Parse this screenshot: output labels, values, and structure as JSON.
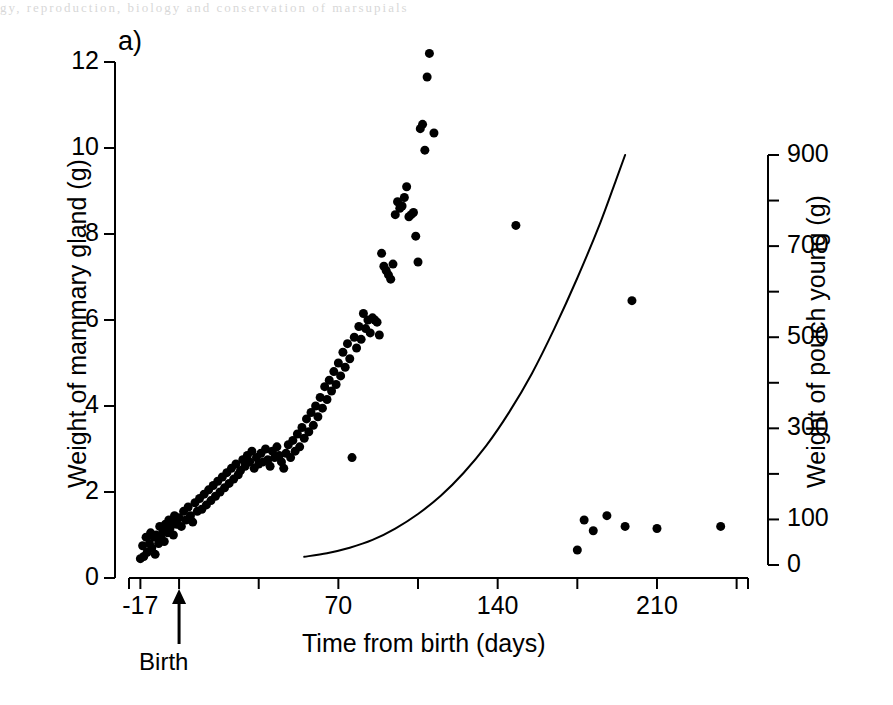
{
  "figure": {
    "panel_label": "a)",
    "page_remnant": "gy, reproduction, biology and conservation of marsupials",
    "background_color": "#ffffff",
    "ink_color": "#000000"
  },
  "axes": {
    "left": {
      "title": "Weight of mammary gland (g)",
      "tick_labels": [
        "0",
        "2",
        "4",
        "6",
        "8",
        "10",
        "12"
      ],
      "range": [
        0,
        12
      ]
    },
    "right": {
      "title": "Weight of pouch young (g)",
      "tick_labels": [
        "0",
        "100",
        "300",
        "500",
        "700",
        "900"
      ],
      "labeled_ticks": [
        0,
        100,
        300,
        500,
        700,
        900
      ],
      "minor_ticks": [
        200,
        400,
        600,
        800
      ],
      "range": [
        0,
        900
      ]
    },
    "x": {
      "title": "Time from birth (days)",
      "tick_labels": [
        "-17",
        "70",
        "140",
        "210"
      ],
      "labeled_ticks": [
        -17,
        70,
        140,
        210
      ],
      "unlabeled_ticks": [
        0,
        35,
        105,
        175,
        245
      ],
      "range": [
        -22,
        250
      ],
      "birth_marker": {
        "label": "Birth",
        "day": 0
      }
    }
  },
  "chart_data": {
    "type": "scatter",
    "title": "",
    "subtitle": "",
    "xlabel": "Time from birth (days)",
    "ylabel": "Weight of mammary gland (g)",
    "y2label": "Weight of pouch young (g)",
    "xlim": [
      -22,
      250
    ],
    "ylim": [
      0,
      12
    ],
    "y2lim": [
      0,
      900
    ],
    "grid": false,
    "legend": "none",
    "annotations": [
      {
        "text": "a)",
        "position": "top-left"
      },
      {
        "text": "Birth",
        "position": "x-axis day 0",
        "marker": "up-arrow"
      }
    ],
    "series": [
      {
        "name": "Weight of mammary gland",
        "type": "scatter",
        "axis": "left",
        "marker": "filled-circle",
        "marker_color": "#000000",
        "marker_size_px": 9,
        "points": [
          [
            -17.0,
            0.45
          ],
          [
            -16.0,
            0.75
          ],
          [
            -15.5,
            0.5
          ],
          [
            -14.5,
            0.95
          ],
          [
            -14.0,
            0.6
          ],
          [
            -13.0,
            0.8
          ],
          [
            -12.5,
            1.05
          ],
          [
            -12.0,
            0.7
          ],
          [
            -11.0,
            0.95
          ],
          [
            -10.5,
            0.55
          ],
          [
            -10.0,
            1.0
          ],
          [
            -9.0,
            0.8
          ],
          [
            -8.5,
            1.2
          ],
          [
            -8.0,
            0.95
          ],
          [
            -7.0,
            1.1
          ],
          [
            -6.5,
            0.85
          ],
          [
            -6.0,
            1.25
          ],
          [
            -5.0,
            1.05
          ],
          [
            -4.5,
            1.35
          ],
          [
            -4.0,
            1.15
          ],
          [
            -3.0,
            1.3
          ],
          [
            -2.5,
            1.0
          ],
          [
            -2.0,
            1.45
          ],
          [
            -1.0,
            1.25
          ],
          [
            0.0,
            1.4
          ],
          [
            1.0,
            1.2
          ],
          [
            2.0,
            1.55
          ],
          [
            3.0,
            1.35
          ],
          [
            4.0,
            1.65
          ],
          [
            5.0,
            1.45
          ],
          [
            6.0,
            1.3
          ],
          [
            7.0,
            1.75
          ],
          [
            8.0,
            1.55
          ],
          [
            9.0,
            1.85
          ],
          [
            10.0,
            1.6
          ],
          [
            11.0,
            1.95
          ],
          [
            12.0,
            1.7
          ],
          [
            13.0,
            2.05
          ],
          [
            14.0,
            1.8
          ],
          [
            15.0,
            2.15
          ],
          [
            16.0,
            1.9
          ],
          [
            17.0,
            2.25
          ],
          [
            18.0,
            2.0
          ],
          [
            19.0,
            2.35
          ],
          [
            20.0,
            2.1
          ],
          [
            21.0,
            2.45
          ],
          [
            22.0,
            2.2
          ],
          [
            23.0,
            2.55
          ],
          [
            24.0,
            2.3
          ],
          [
            25.0,
            2.65
          ],
          [
            26.0,
            2.4
          ],
          [
            27.0,
            2.5
          ],
          [
            28.0,
            2.75
          ],
          [
            29.0,
            2.6
          ],
          [
            30.0,
            2.85
          ],
          [
            31.0,
            2.7
          ],
          [
            32.0,
            2.95
          ],
          [
            33.0,
            2.55
          ],
          [
            34.0,
            2.8
          ],
          [
            35.0,
            2.65
          ],
          [
            36.0,
            2.9
          ],
          [
            37.0,
            2.7
          ],
          [
            38.0,
            3.0
          ],
          [
            39.0,
            2.75
          ],
          [
            40.0,
            2.6
          ],
          [
            41.0,
            2.95
          ],
          [
            42.0,
            2.8
          ],
          [
            43.0,
            3.05
          ],
          [
            44.0,
            2.85
          ],
          [
            45.0,
            2.7
          ],
          [
            46.0,
            2.55
          ],
          [
            47.0,
            2.9
          ],
          [
            48.0,
            3.1
          ],
          [
            49.0,
            2.8
          ],
          [
            50.0,
            3.2
          ],
          [
            51.0,
            2.95
          ],
          [
            52.0,
            3.35
          ],
          [
            53.0,
            3.05
          ],
          [
            54.0,
            3.5
          ],
          [
            55.0,
            3.25
          ],
          [
            56.0,
            3.7
          ],
          [
            57.0,
            3.4
          ],
          [
            58.0,
            3.85
          ],
          [
            59.0,
            3.55
          ],
          [
            60.0,
            4.0
          ],
          [
            61.0,
            3.75
          ],
          [
            62.0,
            4.2
          ],
          [
            63.0,
            3.95
          ],
          [
            64.0,
            4.45
          ],
          [
            65.0,
            4.15
          ],
          [
            66.0,
            4.6
          ],
          [
            67.0,
            4.35
          ],
          [
            68.0,
            4.8
          ],
          [
            69.0,
            4.5
          ],
          [
            70.0,
            5.0
          ],
          [
            71.0,
            4.7
          ],
          [
            72.0,
            5.25
          ],
          [
            73.0,
            4.9
          ],
          [
            74.0,
            5.45
          ],
          [
            75.0,
            5.1
          ],
          [
            76.0,
            2.8
          ],
          [
            77.0,
            5.6
          ],
          [
            78.0,
            5.35
          ],
          [
            79.0,
            5.85
          ],
          [
            80.0,
            5.55
          ],
          [
            81.0,
            6.15
          ],
          [
            82.0,
            5.8
          ],
          [
            83.0,
            6.0
          ],
          [
            84.0,
            5.7
          ],
          [
            85.0,
            6.05
          ],
          [
            86.0,
            6.0
          ],
          [
            87.0,
            5.95
          ],
          [
            88.0,
            5.65
          ],
          [
            89.0,
            7.55
          ],
          [
            90.0,
            7.25
          ],
          [
            91.0,
            7.15
          ],
          [
            92.0,
            7.05
          ],
          [
            93.0,
            6.95
          ],
          [
            94.0,
            7.3
          ],
          [
            95.0,
            8.45
          ],
          [
            96.0,
            8.75
          ],
          [
            97.0,
            8.6
          ],
          [
            98.0,
            8.65
          ],
          [
            99.0,
            8.85
          ],
          [
            100.0,
            9.1
          ],
          [
            101.0,
            8.4
          ],
          [
            102.0,
            8.45
          ],
          [
            103.0,
            8.5
          ],
          [
            104.0,
            7.95
          ],
          [
            105.0,
            7.35
          ],
          [
            106.0,
            10.45
          ],
          [
            107.0,
            10.55
          ],
          [
            108.0,
            9.95
          ],
          [
            109.0,
            11.65
          ],
          [
            110.0,
            12.2
          ],
          [
            112.0,
            10.35
          ],
          [
            148.0,
            8.2
          ],
          [
            175.0,
            0.65
          ],
          [
            178.0,
            1.35
          ],
          [
            182.0,
            1.1
          ],
          [
            188.0,
            1.45
          ],
          [
            196.0,
            1.2
          ],
          [
            199.0,
            6.45
          ],
          [
            210.0,
            1.15
          ],
          [
            238.0,
            1.2
          ]
        ]
      },
      {
        "name": "Weight of pouch young (fitted curve)",
        "type": "line",
        "axis": "right",
        "line_color": "#000000",
        "line_width_px": 2,
        "points": [
          [
            55,
            18
          ],
          [
            65,
            26
          ],
          [
            75,
            38
          ],
          [
            85,
            55
          ],
          [
            95,
            80
          ],
          [
            105,
            112
          ],
          [
            115,
            152
          ],
          [
            125,
            202
          ],
          [
            135,
            262
          ],
          [
            145,
            335
          ],
          [
            155,
            420
          ],
          [
            165,
            520
          ],
          [
            175,
            630
          ],
          [
            185,
            750
          ],
          [
            192,
            845
          ],
          [
            196,
            900
          ]
        ]
      }
    ]
  }
}
